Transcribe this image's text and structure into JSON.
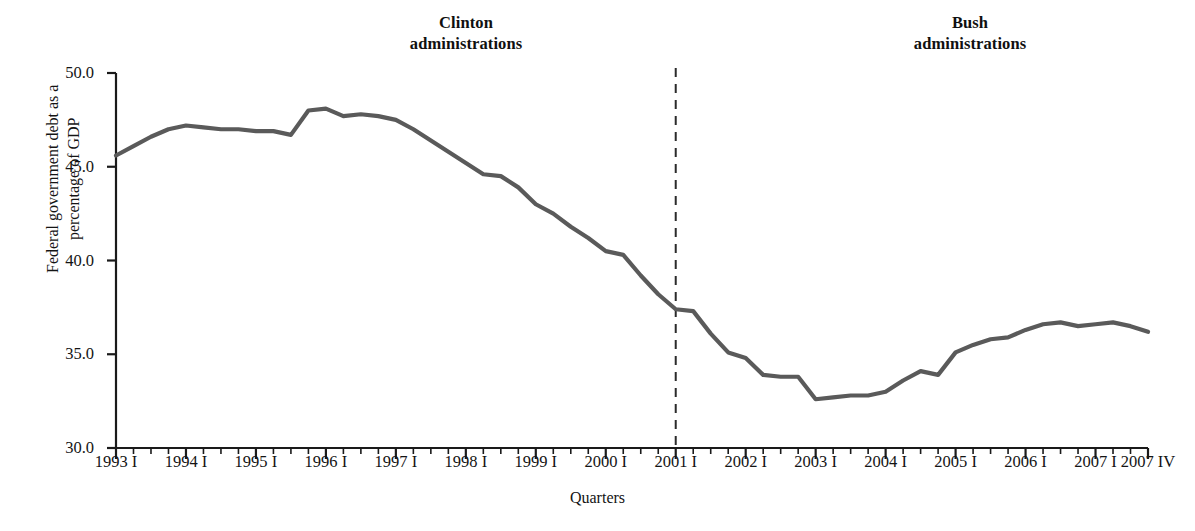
{
  "annotations": {
    "clinton": {
      "line1": "Clinton",
      "line2": "administrations"
    },
    "bush": {
      "line1": "Bush",
      "line2": "administrations"
    }
  },
  "axis_titles": {
    "y_line1": "Federal government debt as a",
    "y_line2": "percentage of GDP",
    "x": "Quarters"
  },
  "colors": {
    "line": "#5a5a5a",
    "axis": "#1a1a1a",
    "divider": "#2b2b2b",
    "background": "#ffffff"
  },
  "chart_data": {
    "type": "line",
    "title": "",
    "xlabel": "Quarters",
    "ylabel": "Federal government debt as a percentage of GDP",
    "ylim": [
      30.0,
      50.0
    ],
    "ytick_labels": [
      "30.0",
      "35.0",
      "40.0",
      "45.0",
      "50.0"
    ],
    "ytick_values": [
      30.0,
      35.0,
      40.0,
      45.0,
      50.0
    ],
    "grid": false,
    "legend": "none",
    "xtick_labels": [
      "1993 I",
      "1994 I",
      "1995 I",
      "1996 I",
      "1997 I",
      "1998 I",
      "1999 I",
      "2000 I",
      "2001 I",
      "2002 I",
      "2003 I",
      "2004 I",
      "2005 I",
      "2006 I",
      "2007 I",
      "2007 IV"
    ],
    "xtick_index": [
      0,
      4,
      8,
      12,
      16,
      20,
      24,
      28,
      32,
      36,
      40,
      44,
      48,
      52,
      56,
      59
    ],
    "minor_ticks_per_year": 4,
    "x": [
      "1993 I",
      "1993 II",
      "1993 III",
      "1993 IV",
      "1994 I",
      "1994 II",
      "1994 III",
      "1994 IV",
      "1995 I",
      "1995 II",
      "1995 III",
      "1995 IV",
      "1996 I",
      "1996 II",
      "1996 III",
      "1996 IV",
      "1997 I",
      "1997 II",
      "1997 III",
      "1997 IV",
      "1998 I",
      "1998 II",
      "1998 III",
      "1998 IV",
      "1999 I",
      "1999 II",
      "1999 III",
      "1999 IV",
      "2000 I",
      "2000 II",
      "2000 III",
      "2000 IV",
      "2001 I",
      "2001 II",
      "2001 III",
      "2001 IV",
      "2002 I",
      "2002 II",
      "2002 III",
      "2002 IV",
      "2003 I",
      "2003 II",
      "2003 III",
      "2003 IV",
      "2004 I",
      "2004 II",
      "2004 III",
      "2004 IV",
      "2005 I",
      "2005 II",
      "2005 III",
      "2005 IV",
      "2006 I",
      "2006 II",
      "2006 III",
      "2006 IV",
      "2007 I",
      "2007 II",
      "2007 III",
      "2007 IV"
    ],
    "values": [
      45.6,
      46.1,
      46.6,
      47.0,
      47.2,
      47.1,
      47.0,
      47.0,
      46.9,
      46.9,
      46.7,
      48.0,
      48.1,
      47.7,
      47.8,
      47.7,
      47.5,
      47.0,
      46.4,
      45.8,
      45.2,
      44.6,
      44.5,
      43.9,
      43.0,
      42.5,
      41.8,
      41.2,
      40.5,
      40.3,
      39.2,
      38.2,
      37.4,
      37.3,
      36.1,
      35.1,
      34.8,
      33.9,
      33.8,
      33.8,
      32.6,
      32.7,
      32.8,
      32.8,
      33.0,
      33.6,
      34.1,
      33.9,
      35.1,
      35.5,
      35.8,
      35.9,
      36.3,
      36.6,
      36.7,
      36.5,
      36.6,
      36.7,
      36.5,
      36.2
    ],
    "series": [
      {
        "name": "Federal government debt as a percentage of GDP",
        "color": "#5a5a5a"
      }
    ],
    "annotations": [
      {
        "text": "Clinton administrations",
        "type": "region-label",
        "span": [
          "1993 I",
          "2001 I"
        ]
      },
      {
        "text": "Bush administrations",
        "type": "region-label",
        "span": [
          "2001 I",
          "2007 IV"
        ]
      },
      {
        "text": "",
        "type": "vertical-dashed-divider",
        "at": "2001 I"
      }
    ]
  },
  "plot_geometry": {
    "left": 116,
    "right": 1148,
    "top": 73,
    "bottom": 448,
    "divider_x": 657
  }
}
